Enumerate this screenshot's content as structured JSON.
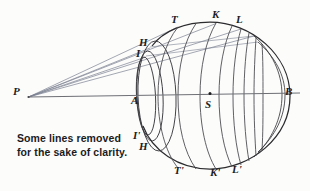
{
  "figure": {
    "caption": "Some lines removed\nfor the sake of clarity.",
    "colors": {
      "background": "#fcfcfb",
      "outline": "#2b2b2e",
      "meridian": "#4e4e54",
      "ray": "#7b8190",
      "axis": "#6d6f75",
      "label": "#1d1d1f"
    },
    "labels": [
      {
        "id": "P",
        "text": "P",
        "x": 13,
        "y": 86,
        "role": "external-point"
      },
      {
        "id": "T",
        "text": "T",
        "x": 171,
        "y": 14,
        "role": "tangent-point-upper"
      },
      {
        "id": "K",
        "text": "K",
        "x": 212,
        "y": 9,
        "role": "tangent-point-upper"
      },
      {
        "id": "L",
        "text": "L",
        "x": 236,
        "y": 14,
        "role": "tangent-point-upper"
      },
      {
        "id": "H",
        "text": "H",
        "x": 139,
        "y": 37,
        "role": "tangent-point-upper"
      },
      {
        "id": "I",
        "text": "I",
        "x": 136,
        "y": 48,
        "role": "tangent-point-upper"
      },
      {
        "id": "A",
        "text": "A",
        "x": 131,
        "y": 95,
        "role": "axis-near-pole"
      },
      {
        "id": "S",
        "text": "S",
        "x": 205,
        "y": 99,
        "role": "sphere-centre"
      },
      {
        "id": "B",
        "text": "B",
        "x": 285,
        "y": 86,
        "role": "axis-far-pole"
      },
      {
        "id": "Ip",
        "text": "I'",
        "x": 133,
        "y": 130,
        "role": "tangent-point-lower"
      },
      {
        "id": "Hp",
        "text": "H",
        "x": 139,
        "y": 141,
        "role": "tangent-point-lower"
      },
      {
        "id": "Tp",
        "text": "T'",
        "x": 174,
        "y": 165,
        "role": "tangent-point-lower"
      },
      {
        "id": "Kp",
        "text": "K'",
        "x": 210,
        "y": 167,
        "role": "tangent-point-lower"
      },
      {
        "id": "Lp",
        "text": "L'",
        "x": 232,
        "y": 164,
        "role": "tangent-point-lower"
      }
    ],
    "geometry": {
      "apex": {
        "x": 28,
        "y": 97
      },
      "centre": {
        "x": 210,
        "y": 96
      },
      "axis": {
        "x1": 28,
        "y1": 97,
        "x2": 300,
        "y2": 93
      },
      "sphere": {
        "cx": 212,
        "cy": 96,
        "rx": 78,
        "ry": 73
      }
    }
  }
}
